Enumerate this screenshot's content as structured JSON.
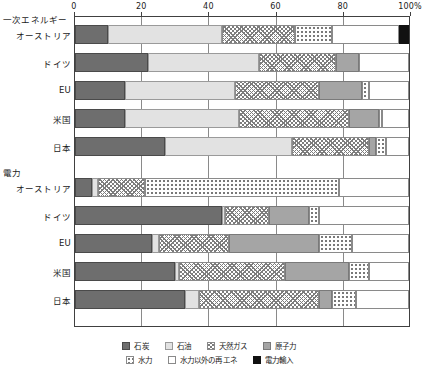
{
  "chart_data": {
    "type": "bar",
    "orientation": "horizontal",
    "stacked": true,
    "percent": true,
    "title": "",
    "xlabel": "",
    "ylabel": "",
    "xlim": [
      0,
      100
    ],
    "xticks": [
      0,
      20,
      40,
      60,
      80,
      100
    ],
    "xticklabels": [
      "0",
      "20",
      "40",
      "60",
      "80",
      "100%"
    ],
    "grid": true,
    "legend_position": "bottom",
    "series": [
      {
        "name": "石炭",
        "key": "coal",
        "pattern": "solid-dark-gray",
        "color": "#6e6e6e"
      },
      {
        "name": "石油",
        "key": "oil",
        "pattern": "solid-light-gray",
        "color": "#e2e2e2"
      },
      {
        "name": "天然ガス",
        "key": "gas",
        "pattern": "cross-hatch",
        "color": "#7d7d7d"
      },
      {
        "name": "原子力",
        "key": "nuclear",
        "pattern": "solid-mid-gray",
        "color": "#a5a5a5"
      },
      {
        "name": "水力",
        "key": "hydro",
        "pattern": "dotted",
        "color": "#6f6f6f"
      },
      {
        "name": "水力以外の再エネ",
        "key": "renewable",
        "pattern": "white",
        "color": "#ffffff"
      },
      {
        "name": "電力輸入",
        "key": "import",
        "pattern": "solid-black",
        "color": "#111111"
      }
    ],
    "groups": [
      {
        "label": "一次エネルギー",
        "rows": [
          {
            "category": "オーストリア",
            "values": {
              "coal": 10,
              "oil": 34,
              "gas": 22,
              "nuclear": 0,
              "hydro": 11,
              "renewable": 20,
              "import": 3
            }
          },
          {
            "category": "ドイツ",
            "values": {
              "coal": 22,
              "oil": 33,
              "gas": 23,
              "nuclear": 7,
              "hydro": 0,
              "renewable": 15,
              "import": 0
            }
          },
          {
            "category": "EU",
            "values": {
              "coal": 15,
              "oil": 33,
              "gas": 25,
              "nuclear": 13,
              "hydro": 2,
              "renewable": 12,
              "import": 0
            }
          },
          {
            "category": "米国",
            "values": {
              "coal": 15,
              "oil": 34,
              "gas": 33,
              "nuclear": 9,
              "hydro": 1,
              "renewable": 8,
              "import": 0
            }
          },
          {
            "category": "日本",
            "values": {
              "coal": 27,
              "oil": 38,
              "gas": 23,
              "nuclear": 2,
              "hydro": 3,
              "renewable": 7,
              "import": 0
            }
          }
        ]
      },
      {
        "label": "電力",
        "rows": [
          {
            "category": "オーストリア",
            "values": {
              "coal": 5,
              "oil": 2,
              "gas": 14,
              "nuclear": 0,
              "hydro": 58,
              "renewable": 21,
              "import": 0
            }
          },
          {
            "category": "ドイツ",
            "values": {
              "coal": 44,
              "oil": 1,
              "gas": 13,
              "nuclear": 12,
              "hydro": 3,
              "renewable": 27,
              "import": 0
            }
          },
          {
            "category": "EU",
            "values": {
              "coal": 23,
              "oil": 2,
              "gas": 21,
              "nuclear": 27,
              "hydro": 10,
              "renewable": 17,
              "import": 0
            }
          },
          {
            "category": "米国",
            "values": {
              "coal": 30,
              "oil": 1,
              "gas": 32,
              "nuclear": 19,
              "hydro": 6,
              "renewable": 12,
              "import": 0
            }
          },
          {
            "category": "日本",
            "values": {
              "coal": 33,
              "oil": 4,
              "gas": 36,
              "nuclear": 4,
              "hydro": 7,
              "renewable": 16,
              "import": 0
            }
          }
        ]
      }
    ]
  }
}
